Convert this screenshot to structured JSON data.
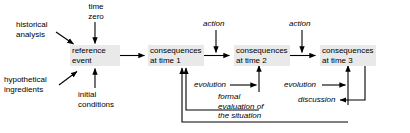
{
  "diagram": {
    "colors": {
      "background": "#ffffff",
      "node_fill": "#e9e9e9",
      "stroke": "#000000",
      "text": "#000000"
    },
    "nodes": [
      {
        "id": "reference-event",
        "label": "reference\nevent",
        "style": "box"
      },
      {
        "id": "consequences-time-1",
        "label": "consequences\nat time 1",
        "style": "box"
      },
      {
        "id": "consequences-time-2",
        "label": "consequences\nat time 2",
        "style": "box"
      },
      {
        "id": "consequences-time-3",
        "label": "consequences\nat time 3",
        "style": "box"
      }
    ],
    "inputs": [
      {
        "id": "historical-analysis",
        "label": "historical\nanalysis",
        "style": "plain"
      },
      {
        "id": "time-zero",
        "label": "time\nzero",
        "style": "plain"
      },
      {
        "id": "hypothetical-ingredients",
        "label": "hypothetical\ningredients",
        "style": "plain"
      },
      {
        "id": "initial-conditions",
        "label": "initial\nconditions",
        "style": "plain"
      }
    ],
    "edge_labels": [
      {
        "id": "action-1",
        "label": "action",
        "style": "italic"
      },
      {
        "id": "action-2",
        "label": "action",
        "style": "italic"
      },
      {
        "id": "evolution-1",
        "label": "evolution",
        "style": "italic"
      },
      {
        "id": "evolution-2",
        "label": "evolution",
        "style": "italic"
      },
      {
        "id": "formal-evaluation",
        "label": "formal\nevaluation of\nthe situation",
        "style": "italic"
      },
      {
        "id": "discussion",
        "label": "discussion",
        "style": "italic"
      }
    ],
    "flows": [
      "historical analysis -> reference event",
      "time zero -> reference event",
      "hypothetical ingredients -> reference event",
      "initial conditions -> reference event",
      "reference event -> consequences at time 1",
      "consequences at time 1 -> consequences at time 2 (action)",
      "consequences at time 2 -> consequences at time 3 (action)",
      "evolution -> consequences at time 2",
      "evolution -> consequences at time 3",
      "formal evaluation of the situation -> consequences at time 1",
      "discussion -> consequences at time 1"
    ]
  }
}
